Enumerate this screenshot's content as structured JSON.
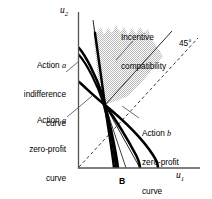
{
  "figure": {
    "title_visible": false,
    "axes": {
      "x_label": "u",
      "x_label_sub": "1",
      "y_label": "u",
      "y_label_sub": "2"
    },
    "point_labels": [
      {
        "name": "point-B",
        "text": "B"
      }
    ],
    "annotations": [
      {
        "name": "action-a-indifference-curve",
        "lines": [
          "Action a",
          "indifference",
          "curve"
        ],
        "align": "right"
      },
      {
        "name": "action-a-zero-profit-curve",
        "lines": [
          "Action a",
          "zero-profit",
          "curve"
        ],
        "align": "right"
      },
      {
        "name": "incentive-compatibility",
        "lines": [
          "Incentive",
          "compatibility"
        ],
        "align": "left"
      },
      {
        "name": "action-b-zero-profit-curve",
        "lines": [
          "Action b",
          "zero-profit",
          "curve"
        ],
        "align": "left"
      },
      {
        "name": "forty-five-degree-line",
        "lines": [
          "45°"
        ],
        "align": "left"
      }
    ],
    "colors": {
      "axis": "#4a4a4a",
      "curve": "#000000",
      "shading": "#d6d6d6",
      "dashed": "#333333",
      "background": "#ffffff"
    }
  },
  "chart_data": {
    "type": "line",
    "title": "",
    "xlabel": "u1",
    "ylabel": "u2",
    "grid": false,
    "legend": "annotations-inline",
    "xlim": [
      0,
      1
    ],
    "ylim": [
      0,
      1
    ],
    "origin_px": [
      78,
      168
    ],
    "x_axis_end_px": [
      200,
      168
    ],
    "y_axis_end_px": [
      78,
      12
    ],
    "intersection_point_px": [
      105,
      105
    ],
    "series": [
      {
        "name": "Action a indifference curve",
        "style": "thick-solid",
        "points_px": [
          [
            79,
            49
          ],
          [
            88,
            60
          ],
          [
            97,
            80
          ],
          [
            104,
            101
          ],
          [
            110,
            124
          ],
          [
            116,
            146
          ],
          [
            119,
            166
          ]
        ]
      },
      {
        "name": "Action a indifference curve (second branch)",
        "style": "thick-solid",
        "points_px": [
          [
            79,
            54
          ],
          [
            89,
            67
          ],
          [
            98,
            86
          ],
          [
            105,
            105
          ],
          [
            111,
            128
          ],
          [
            115,
            150
          ],
          [
            117,
            167
          ]
        ]
      },
      {
        "name": "Action a zero-profit curve",
        "style": "thick-solid",
        "points_px": [
          [
            79,
            83
          ],
          [
            86,
            88
          ],
          [
            94,
            96
          ],
          [
            105,
            105
          ],
          [
            120,
            116
          ],
          [
            138,
            132
          ],
          [
            152,
            152
          ],
          [
            158,
            167
          ]
        ]
      },
      {
        "name": "Action b zero-profit curve",
        "style": "thick-solid",
        "points_px": [
          [
            95,
            34
          ],
          [
            99,
            56
          ],
          [
            103,
            82
          ],
          [
            105,
            105
          ],
          [
            110,
            130
          ],
          [
            114,
            150
          ],
          [
            117,
            167
          ]
        ]
      },
      {
        "name": "Incentive compatibility boundary",
        "style": "thin-solid",
        "points_px": [
          [
            105,
            20
          ],
          [
            105,
            105
          ],
          [
            137,
            167
          ]
        ]
      },
      {
        "name": "Incentive compatibility ray",
        "style": "thin-solid",
        "points_px": [
          [
            105,
            105
          ],
          [
            170,
            33
          ]
        ]
      },
      {
        "name": "45 degree line",
        "style": "dashed",
        "points_px": [
          [
            79,
            167
          ],
          [
            196,
            40
          ]
        ]
      },
      {
        "name": "Shaded feasible region",
        "style": "filled",
        "points_px": [
          [
            105,
            105
          ],
          [
            93,
            25
          ],
          [
            104,
            35
          ],
          [
            118,
            24
          ],
          [
            131,
            36
          ],
          [
            145,
            26
          ],
          [
            152,
            40
          ],
          [
            160,
            52
          ]
        ]
      }
    ]
  }
}
